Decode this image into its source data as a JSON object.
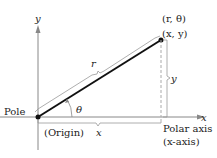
{
  "diagram": {
    "labels": {
      "y_axis": "y",
      "x_axis": "x",
      "polar_coords": "(r, θ)",
      "rect_coords": "(x, y)",
      "r": "r",
      "y_brace": "y",
      "theta": "θ",
      "pole": "Pole",
      "origin": "(Origin)",
      "x_brace": "x",
      "polar_axis": "Polar axis",
      "x_axis_note": "(x-axis)"
    },
    "colors": {
      "line": "#111111",
      "axis": "#888888",
      "dashed": "#aaaaaa"
    }
  }
}
